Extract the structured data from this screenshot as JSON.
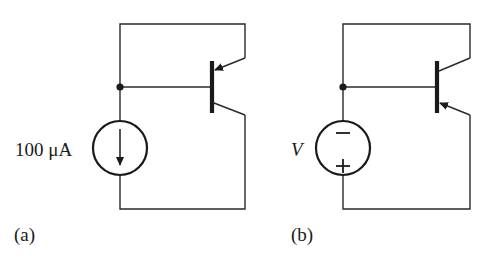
{
  "figure": {
    "panels": [
      {
        "id": "a",
        "caption": "(a)",
        "source_type": "current-source",
        "source_label": "100 μA",
        "transistor_type": "pnp",
        "components": [
          "current source 100 μA",
          "bipolar transistor (diode-connected, emitter arrow at top)"
        ]
      },
      {
        "id": "b",
        "caption": "(b)",
        "source_type": "voltage-source",
        "source_label": "V",
        "minus_sign": "−",
        "plus_sign": "+",
        "transistor_type": "npn",
        "components": [
          "voltage source V",
          "bipolar transistor (diode-connected, emitter arrow at bottom)"
        ]
      }
    ]
  },
  "colors": {
    "wire": "#2a2a2a",
    "background": "#ffffff"
  }
}
